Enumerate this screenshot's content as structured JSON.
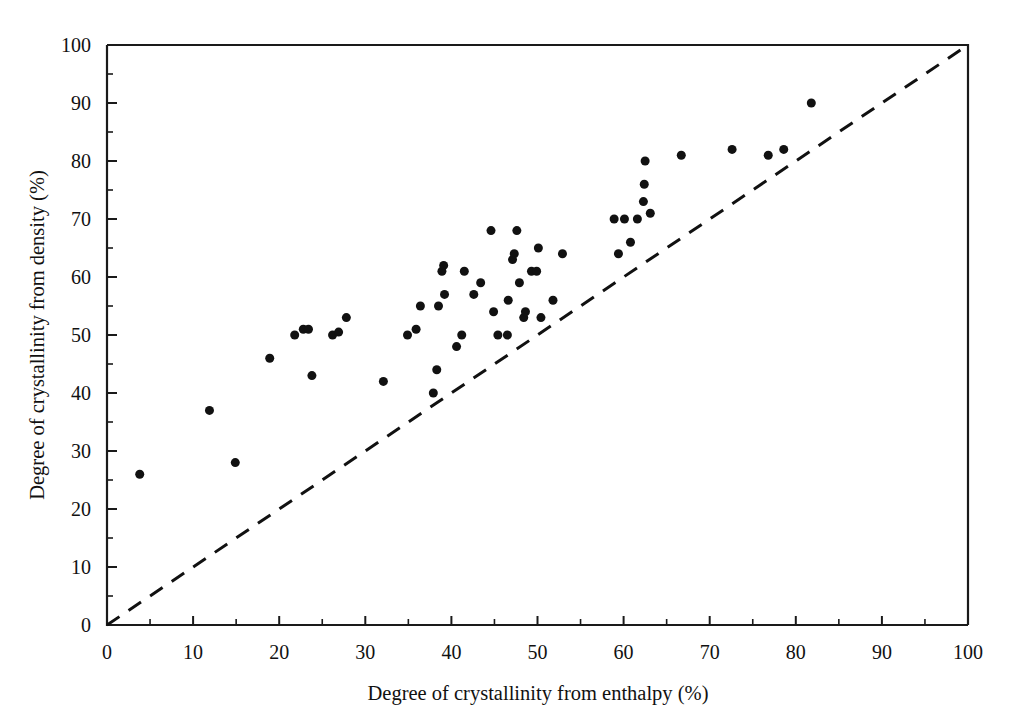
{
  "chart_data": {
    "type": "scatter",
    "title": "",
    "xlabel": "Degree of crystallinity from enthalpy (%)",
    "ylabel": "Degree of crystallinity from density (%)",
    "xlim": [
      0,
      100
    ],
    "ylim": [
      0,
      100
    ],
    "xticks": [
      0,
      10,
      20,
      30,
      40,
      50,
      60,
      70,
      80,
      90,
      100
    ],
    "yticks": [
      0,
      10,
      20,
      30,
      40,
      50,
      60,
      70,
      80,
      90,
      100
    ],
    "xticklabels": [
      "0",
      "10",
      "20",
      "30",
      "40",
      "50",
      "60",
      "70",
      "80",
      "90",
      "100"
    ],
    "yticklabels": [
      "0",
      "10",
      "20",
      "30",
      "40",
      "50",
      "60",
      "70",
      "80",
      "90",
      "100"
    ],
    "minor_ticks_per_interval": 1,
    "grid": false,
    "legend": null,
    "marker": "filled-circle",
    "marker_color": "#111111",
    "marker_size_px": 9,
    "reference_line": {
      "name": "y = x parity line",
      "style": "dashed",
      "color": "#111111",
      "from": [
        0,
        0
      ],
      "to": [
        100,
        100
      ]
    },
    "points": [
      [
        3.8,
        26
      ],
      [
        11.9,
        37
      ],
      [
        14.9,
        28
      ],
      [
        18.9,
        46
      ],
      [
        21.8,
        50
      ],
      [
        22.8,
        51
      ],
      [
        23.4,
        51
      ],
      [
        23.8,
        43
      ],
      [
        26.2,
        50
      ],
      [
        26.9,
        50.5
      ],
      [
        27.8,
        53
      ],
      [
        32.1,
        42
      ],
      [
        34.9,
        50
      ],
      [
        35.9,
        51
      ],
      [
        36.4,
        55
      ],
      [
        37.9,
        40
      ],
      [
        38.3,
        44
      ],
      [
        38.5,
        55
      ],
      [
        38.9,
        61
      ],
      [
        39.1,
        62
      ],
      [
        39.2,
        57
      ],
      [
        40.6,
        48
      ],
      [
        41.2,
        50
      ],
      [
        41.5,
        61
      ],
      [
        42.6,
        57
      ],
      [
        43.4,
        59
      ],
      [
        44.6,
        68
      ],
      [
        44.9,
        54
      ],
      [
        45.4,
        50
      ],
      [
        46.5,
        50
      ],
      [
        46.6,
        56
      ],
      [
        47.1,
        63
      ],
      [
        47.3,
        64
      ],
      [
        47.6,
        68
      ],
      [
        47.9,
        59
      ],
      [
        48.4,
        53
      ],
      [
        48.6,
        54
      ],
      [
        49.3,
        61
      ],
      [
        49.9,
        61
      ],
      [
        50.1,
        65
      ],
      [
        50.4,
        53
      ],
      [
        51.8,
        56
      ],
      [
        52.9,
        64
      ],
      [
        58.9,
        70
      ],
      [
        59.4,
        64
      ],
      [
        60.1,
        70
      ],
      [
        60.8,
        66
      ],
      [
        61.6,
        70
      ],
      [
        62.3,
        73
      ],
      [
        62.4,
        76
      ],
      [
        62.5,
        80
      ],
      [
        63.1,
        71
      ],
      [
        66.7,
        81
      ],
      [
        72.6,
        82
      ],
      [
        76.8,
        81
      ],
      [
        78.6,
        82
      ],
      [
        81.8,
        90
      ]
    ],
    "n_points": 57
  }
}
